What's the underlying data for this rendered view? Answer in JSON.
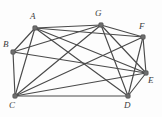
{
  "figure": {
    "kind": "undirected-graph-diagram",
    "width": 162,
    "height": 117,
    "background_color": "#fdfdfd",
    "edge_color": "#4a4a4a",
    "vertex_color": "#6e6e6e",
    "label_color": "#3c3c3c"
  },
  "chart_data": {
    "type": "scatter",
    "title": "",
    "xlabel": "",
    "ylabel": "",
    "grid": false,
    "legend": "none",
    "xlim": [
      0,
      162
    ],
    "ylim": [
      0,
      117
    ],
    "vertices": [
      {
        "id": "A",
        "label": "A",
        "x": 35,
        "y": 28,
        "label_x": 30,
        "label_y": 12,
        "degree": 6
      },
      {
        "id": "B",
        "label": "B",
        "x": 13,
        "y": 52,
        "label_x": 3,
        "label_y": 40,
        "degree": 4
      },
      {
        "id": "C",
        "label": "C",
        "x": 15,
        "y": 96,
        "label_x": 9,
        "label_y": 101,
        "degree": 7
      },
      {
        "id": "D",
        "label": "D",
        "x": 128,
        "y": 96,
        "label_x": 124,
        "label_y": 101,
        "degree": 5
      },
      {
        "id": "E",
        "label": "E",
        "x": 146,
        "y": 73,
        "label_x": 148,
        "label_y": 76,
        "degree": 8
      },
      {
        "id": "F",
        "label": "F",
        "x": 143,
        "y": 37,
        "label_x": 139,
        "label_y": 22,
        "degree": 5
      },
      {
        "id": "G",
        "label": "G",
        "x": 101,
        "y": 25,
        "label_x": 95,
        "label_y": 9,
        "degree": 6
      }
    ],
    "edges": [
      {
        "from": "A",
        "to": "B"
      },
      {
        "from": "A",
        "to": "C"
      },
      {
        "from": "A",
        "to": "G"
      },
      {
        "from": "A",
        "to": "D"
      },
      {
        "from": "A",
        "to": "E"
      },
      {
        "from": "A",
        "to": "F"
      },
      {
        "from": "B",
        "to": "C"
      },
      {
        "from": "B",
        "to": "E"
      },
      {
        "from": "B",
        "to": "G"
      },
      {
        "from": "C",
        "to": "D"
      },
      {
        "from": "C",
        "to": "E"
      },
      {
        "from": "C",
        "to": "F"
      },
      {
        "from": "C",
        "to": "G"
      },
      {
        "from": "D",
        "to": "E"
      },
      {
        "from": "D",
        "to": "F"
      },
      {
        "from": "D",
        "to": "G"
      },
      {
        "from": "E",
        "to": "F"
      },
      {
        "from": "E",
        "to": "G"
      },
      {
        "from": "F",
        "to": "G"
      }
    ],
    "vertex_count": 7,
    "edge_count": 19
  }
}
